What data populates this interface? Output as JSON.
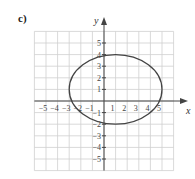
{
  "part_label": "c)",
  "chart_data": {
    "type": "line",
    "title": "",
    "xlabel": "x",
    "ylabel": "y",
    "xlim": [
      -6,
      6
    ],
    "ylim": [
      -6,
      6
    ],
    "grid": true,
    "x_ticks": [
      "−5",
      "−4",
      "−3",
      "−2",
      "−1",
      "1",
      "2",
      "3",
      "4",
      "5"
    ],
    "y_ticks": [
      "5",
      "4",
      "3",
      "2",
      "1",
      "−1",
      "−2",
      "−3",
      "−4",
      "−5"
    ],
    "series": [
      {
        "name": "ellipse",
        "shape": "ellipse",
        "center": [
          1,
          1
        ],
        "semi_axis_x": 4,
        "semi_axis_y": 3,
        "color": "#444444"
      }
    ]
  }
}
